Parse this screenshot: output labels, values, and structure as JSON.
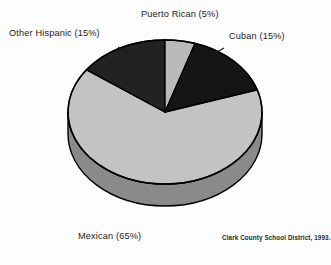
{
  "chart_data": {
    "type": "pie",
    "title": "",
    "subtitle": "",
    "xlabel": "",
    "ylabel": "",
    "legend_position": "outside-callout-labels",
    "grid": false,
    "three_d": true,
    "start_angle_deg": 0,
    "direction": "clockwise",
    "categories": [
      "Puerto Rican",
      "Cuban",
      "Mexican",
      "Other Hispanic"
    ],
    "values": [
      5,
      15,
      65,
      15
    ],
    "unit": "%",
    "slices": [
      {
        "name": "Puerto Rican",
        "value": 5,
        "label": "Puerto Rican (5%)",
        "color": "#b9b9b9",
        "side_color": "#8a8a8a",
        "start_deg": 0,
        "end_deg": 18
      },
      {
        "name": "Cuban",
        "value": 15,
        "label": "Cuban (15%)",
        "color": "#151515",
        "side_color": "#111111",
        "start_deg": 18,
        "end_deg": 72
      },
      {
        "name": "Mexican",
        "value": 65,
        "label": "Mexican  (65%)",
        "color": "#c3c3c3",
        "side_color": "#8a8a8a",
        "start_deg": 72,
        "end_deg": 306
      },
      {
        "name": "Other Hispanic",
        "value": 15,
        "label": "Other Hispanic (15%)",
        "color": "#222222",
        "side_color": "#141414",
        "start_deg": 306,
        "end_deg": 360
      }
    ],
    "annotations": [
      "Clark County School District, 1993."
    ]
  },
  "labels": {
    "puerto_rican": "Puerto Rican (5%)",
    "other_hispanic": "Other Hispanic (15%)",
    "cuban": "Cuban (15%)",
    "mexican": "Mexican  (65%)"
  },
  "source": {
    "text": "Clark County School District, 1993."
  },
  "colors": {
    "background": "#fdfdfd",
    "outline": "#000000",
    "light_gray": "#c3c3c3",
    "mid_gray": "#b9b9b9",
    "side_gray": "#8a8a8a",
    "dark": "#151515",
    "text": "#1c1c1c"
  }
}
